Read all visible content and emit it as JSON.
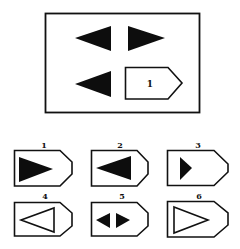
{
  "puzzle": {
    "type": "matrix-analogy",
    "matrix": {
      "cells": [
        {
          "position": "top-left",
          "shape": "triangle",
          "direction": "left",
          "fill": "solid"
        },
        {
          "position": "top-right",
          "shape": "triangle",
          "direction": "right",
          "fill": "solid"
        },
        {
          "position": "bottom-left",
          "shape": "triangle",
          "direction": "left",
          "fill": "solid"
        },
        {
          "position": "bottom-right",
          "shape": "answer-slot",
          "label": "1"
        }
      ]
    },
    "options": [
      {
        "label": "1",
        "content": "large solid triangle pointing right"
      },
      {
        "label": "2",
        "content": "large solid triangle pointing left"
      },
      {
        "label": "3",
        "content": "small solid triangle pointing right"
      },
      {
        "label": "4",
        "content": "outlined triangle pointing left"
      },
      {
        "label": "5",
        "content": "two small solid triangles pointing left and right"
      },
      {
        "label": "6",
        "content": "outlined triangle pointing right"
      }
    ]
  },
  "colors": {
    "ink": "#111111",
    "paper": "#ffffff"
  }
}
